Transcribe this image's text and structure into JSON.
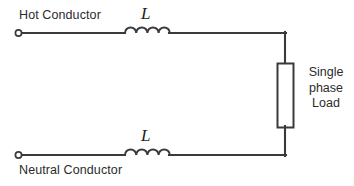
{
  "diagram": {
    "type": "electrical-schematic",
    "canvas": {
      "width": 354,
      "height": 186,
      "background": "#ffffff"
    },
    "colors": {
      "line": "#3a3a3a",
      "text": "#2b2b2b",
      "fill": "#ffffff"
    }
  },
  "labels": {
    "hot_conductor": "Hot Conductor",
    "neutral_conductor": "Neutral Conductor",
    "inductor_top": "L",
    "inductor_bottom": "L",
    "load_line_1": "Single",
    "load_line_2": "phase",
    "load_line_3": "Load"
  },
  "components": [
    {
      "name": "terminal-hot",
      "kind": "open-terminal",
      "label": "Hot Conductor",
      "x": 18,
      "y": 33
    },
    {
      "name": "inductor-top",
      "kind": "inductor",
      "label": "L",
      "humps": 4,
      "x_start": 125,
      "x_end": 170,
      "y": 33
    },
    {
      "name": "terminal-neutral",
      "kind": "open-terminal",
      "label": "Neutral Conductor",
      "x": 18,
      "y": 155
    },
    {
      "name": "inductor-bottom",
      "kind": "inductor",
      "label": "L",
      "humps": 4,
      "x_start": 125,
      "x_end": 170,
      "y": 155
    },
    {
      "name": "load",
      "kind": "rectangular-load",
      "label": "Single phase Load",
      "x": 277,
      "y": 63,
      "width": 16,
      "height": 64
    }
  ],
  "wires": [
    {
      "name": "hot-line-left",
      "from": [
        18,
        33
      ],
      "to": [
        125,
        33
      ]
    },
    {
      "name": "hot-line-right",
      "from": [
        170,
        33
      ],
      "to": [
        285,
        33
      ]
    },
    {
      "name": "load-top-lead",
      "from": [
        285,
        33
      ],
      "to": [
        285,
        63
      ]
    },
    {
      "name": "load-bottom-lead",
      "from": [
        285,
        127
      ],
      "to": [
        285,
        155
      ]
    },
    {
      "name": "neutral-line-right",
      "from": [
        170,
        155
      ],
      "to": [
        285,
        155
      ]
    },
    {
      "name": "neutral-line-left",
      "from": [
        18,
        155
      ],
      "to": [
        125,
        155
      ]
    }
  ]
}
